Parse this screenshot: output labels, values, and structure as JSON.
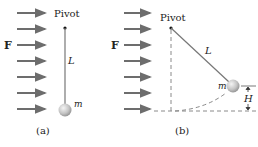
{
  "force_label": "F",
  "pivot_label": "Pivot",
  "length_label": "L",
  "mass_label": "m",
  "height_label": "H",
  "panels": [
    {
      "caption": "(a)"
    },
    {
      "caption": "(b)"
    }
  ],
  "colors": {
    "arrow": "#6d6d6d",
    "rod": "#777777",
    "dashed": "#8a8a8a",
    "ball": "#c8c8c8",
    "text": "#222222"
  }
}
